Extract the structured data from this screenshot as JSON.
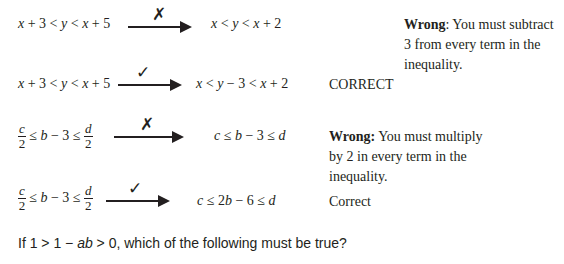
{
  "rows": [
    {
      "left": "x + 3 < y < x + 5",
      "mark": "✗",
      "mark_name": "cross",
      "right": "x < y < x + 2",
      "note_bold": "Wrong",
      "note_text": ": You must subtract 3 from every term in the inequality."
    },
    {
      "left": "x + 3 < y < x + 5",
      "mark": "✓",
      "mark_name": "check",
      "right": "x < y − 3 < x + 2",
      "note_bold": "",
      "note_text": "CORRECT"
    },
    {
      "left_num1": "c",
      "left_den1": "2",
      "left_mid": "≤ b − 3 ≤",
      "left_num2": "d",
      "left_den2": "2",
      "mark": "✗",
      "mark_name": "cross",
      "right": "c ≤ b − 3 ≤ d",
      "note_bold": "Wrong:",
      "note_text": " You must multiply by 2 in every term in the inequality."
    },
    {
      "left_num1": "c",
      "left_den1": "2",
      "left_mid": "≤ b − 3 ≤",
      "left_num2": "d",
      "left_den2": "2",
      "mark": "✓",
      "mark_name": "check",
      "right": "c ≤ 2b − 6 ≤ d",
      "note_bold": "",
      "note_text": "Correct"
    }
  ],
  "question": {
    "prefix": "If 1 > 1 − ",
    "var": "ab",
    "suffix": " > 0, which of the following must be true?"
  }
}
